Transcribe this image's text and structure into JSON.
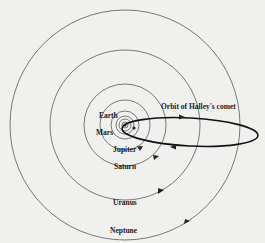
{
  "diagram": {
    "center": {
      "x": 125,
      "y": 125,
      "label": "Sun"
    },
    "orbits": [
      {
        "name": "Mercury",
        "r": 3,
        "labeled": false
      },
      {
        "name": "Venus",
        "r": 6,
        "labeled": false
      },
      {
        "name": "Earth",
        "r": 9,
        "labeled": true
      },
      {
        "name": "Mars",
        "r": 14,
        "labeled": true
      },
      {
        "name": "Jupiter",
        "r": 25,
        "labeled": true
      },
      {
        "name": "Saturn",
        "r": 41,
        "labeled": true
      },
      {
        "name": "Uranus",
        "r": 75,
        "labeled": true
      },
      {
        "name": "Neptune",
        "r": 115,
        "labeled": true
      }
    ],
    "labels": {
      "earth": "Earth",
      "mars": "Mars",
      "jupiter": "Jupiter",
      "saturn": "Saturn",
      "uranus": "Uranus",
      "neptune": "Neptune",
      "comet": "Orbit of Halley's comet"
    },
    "comet_orbit": {
      "cx": 190,
      "cy": 134,
      "rx": 70,
      "ry": 15,
      "rotation": 3
    },
    "colors": {
      "background": "#f0f0ee",
      "line": "#333333",
      "comet": "#111111"
    }
  }
}
